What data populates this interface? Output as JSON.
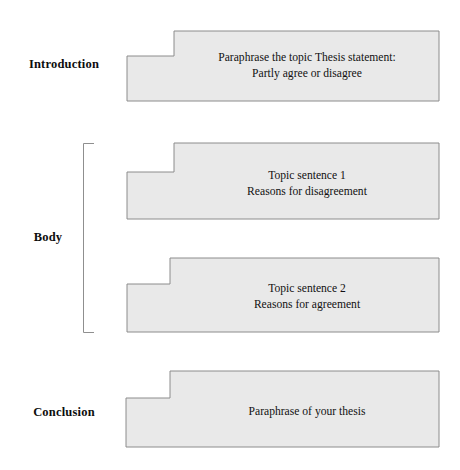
{
  "diagram": {
    "fill_color": "#e9e9e9",
    "stroke_color": "#8c8c8c",
    "background_color": "#ffffff"
  },
  "sections": [
    {
      "label": "Introduction",
      "blocks": [
        {
          "text": "Paraphrase the topic Thesis statement:\nPartly agree or disagree"
        }
      ]
    },
    {
      "label": "Body",
      "bracket": true,
      "blocks": [
        {
          "text": "Topic sentence 1\nReasons for disagreement"
        },
        {
          "text": "Topic sentence 2\nReasons for agreement"
        }
      ]
    },
    {
      "label": "Conclusion",
      "blocks": [
        {
          "text": "Paraphrase of your thesis"
        }
      ]
    }
  ]
}
